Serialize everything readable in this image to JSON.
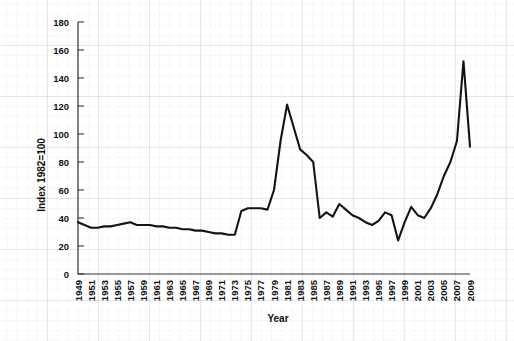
{
  "chart_data": {
    "type": "line",
    "title": "",
    "xlabel": "Year",
    "ylabel": "Index 1982=100",
    "xlim": [
      1949,
      2009
    ],
    "ylim": [
      0,
      180
    ],
    "grid": false,
    "legend": "none",
    "y_ticks": [
      0,
      20,
      40,
      60,
      80,
      100,
      120,
      140,
      160,
      180
    ],
    "x_ticks": [
      1949,
      1951,
      1953,
      1955,
      1957,
      1959,
      1961,
      1963,
      1965,
      1967,
      1969,
      1971,
      1973,
      1975,
      1977,
      1979,
      1981,
      1983,
      1985,
      1987,
      1989,
      1991,
      1993,
      1995,
      1997,
      1999,
      2001,
      2003,
      2005,
      2007,
      2009
    ],
    "x": [
      1949,
      1950,
      1951,
      1952,
      1953,
      1954,
      1955,
      1956,
      1957,
      1958,
      1959,
      1960,
      1961,
      1962,
      1963,
      1964,
      1965,
      1966,
      1967,
      1968,
      1969,
      1970,
      1971,
      1972,
      1973,
      1974,
      1975,
      1976,
      1977,
      1978,
      1979,
      1980,
      1981,
      1982,
      1983,
      1984,
      1985,
      1986,
      1987,
      1988,
      1989,
      1990,
      1991,
      1992,
      1993,
      1994,
      1995,
      1996,
      1997,
      1998,
      1999,
      2000,
      2001,
      2002,
      2003,
      2004,
      2005,
      2006,
      2007,
      2008,
      2009
    ],
    "values": [
      37,
      35,
      33,
      33,
      34,
      34,
      35,
      36,
      37,
      35,
      35,
      35,
      34,
      34,
      33,
      33,
      32,
      32,
      31,
      31,
      30,
      29,
      29,
      28,
      28,
      45,
      47,
      47,
      47,
      46,
      60,
      95,
      121,
      105,
      89,
      85,
      80,
      40,
      44,
      41,
      50,
      46,
      42,
      40,
      37,
      35,
      38,
      44,
      42,
      24,
      37,
      48,
      42,
      40,
      47,
      57,
      70,
      80,
      95,
      152,
      91
    ],
    "series_name": "Index"
  },
  "axes": {
    "y_label": "Index 1982=100",
    "x_label": "Year"
  }
}
